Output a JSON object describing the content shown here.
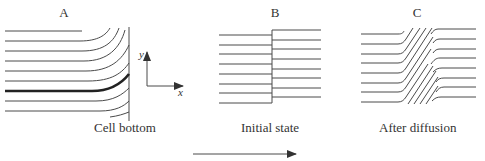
{
  "panels": [
    {
      "id": "A",
      "label": "A",
      "caption": "Cell bottom"
    },
    {
      "id": "B",
      "label": "B",
      "caption": "Initial state"
    },
    {
      "id": "C",
      "label": "C",
      "caption": "After diffusion"
    }
  ],
  "axes": {
    "x_label": "x",
    "y_label": "y"
  },
  "colors": {
    "line": "#4a4a4a",
    "thick_line": "#222222",
    "text": "#333333"
  }
}
